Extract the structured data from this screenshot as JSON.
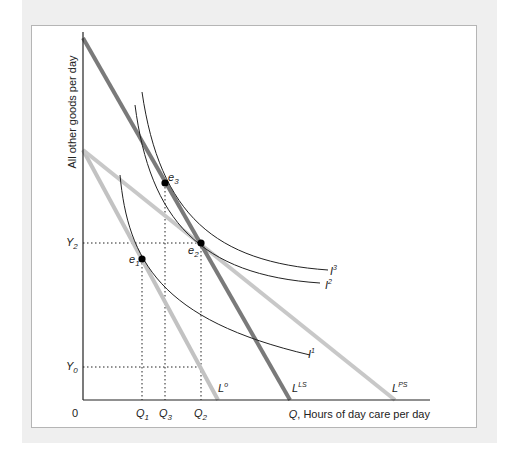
{
  "figure": {
    "y_axis_label": "All other goods per day",
    "x_axis_label_var": "Q",
    "x_axis_label_rest": ", Hours of day care per day",
    "origin_label": "0",
    "x_ticks": [
      {
        "base": "Q",
        "sub": "1"
      },
      {
        "base": "Q",
        "sub": "3"
      },
      {
        "base": "Q",
        "sub": "2"
      }
    ],
    "y_ticks": [
      {
        "base": "Y",
        "sub": "2"
      },
      {
        "base": "Y",
        "sub": "0"
      }
    ],
    "budget_lines": [
      {
        "base": "L",
        "sup": "o",
        "color": "#c0c0c0"
      },
      {
        "base": "L",
        "sup": "LS",
        "color": "#7a7a7a"
      },
      {
        "base": "L",
        "sup": "PS",
        "color": "#c8c8c8"
      }
    ],
    "indifference_curves": [
      {
        "base": "I",
        "sup": "1"
      },
      {
        "base": "I",
        "sup": "2"
      },
      {
        "base": "I",
        "sup": "3"
      }
    ],
    "equilibria": [
      {
        "base": "e",
        "sub": "1"
      },
      {
        "base": "e",
        "sub": "2"
      },
      {
        "base": "e",
        "sub": "3"
      }
    ]
  }
}
